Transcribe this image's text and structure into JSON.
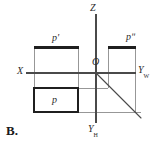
{
  "figure": {
    "item_label": "B.",
    "caption": "",
    "background_color": "#ffffff",
    "line_color": "#3a3a3a",
    "bold_line_color": "#1f1f1f",
    "text_color": "#2b2b2b",
    "axes": [
      {
        "id": "z",
        "label": "Z",
        "sub": "",
        "direction": "up"
      },
      {
        "id": "yw",
        "label": "Y",
        "sub": "W",
        "direction": "right"
      },
      {
        "id": "yh",
        "label": "Y",
        "sub": "H",
        "direction": "down"
      },
      {
        "id": "x",
        "label": "X",
        "sub": "",
        "direction": "left"
      }
    ],
    "origin_label": "O",
    "projections": [
      {
        "id": "front",
        "label": "p'",
        "name": "front-view"
      },
      {
        "id": "side",
        "label": "pʺ",
        "name": "side-view"
      },
      {
        "id": "top",
        "label": "p",
        "name": "top-view"
      }
    ],
    "geometry": {
      "origin": {
        "x": 96,
        "y": 73
      },
      "z_axis": {
        "x1": 96,
        "y1": 14,
        "x2": 96,
        "y2": 123
      },
      "x_axis": {
        "x1": 28,
        "y1": 73,
        "x2": 136,
        "y2": 73
      },
      "yw_axis": {
        "x1": 96,
        "y1": 73,
        "x2": 136,
        "y2": 73
      },
      "bisector": {
        "x1": 97,
        "y1": 74,
        "x2": 141,
        "y2": 118
      },
      "front_rect": {
        "x": 34,
        "y": 48,
        "w": 44,
        "h": 25
      },
      "top_rect": {
        "x": 34,
        "y": 88,
        "w": 44,
        "h": 24
      },
      "side_rect": {
        "x": 108,
        "y": 48,
        "w": 27,
        "h": 25
      },
      "construction_lines": [
        {
          "x1": 34,
          "y1": 48,
          "x2": 34,
          "y2": 112
        },
        {
          "x1": 78,
          "y1": 48,
          "x2": 78,
          "y2": 112
        },
        {
          "x1": 34,
          "y1": 73,
          "x2": 78,
          "y2": 73
        },
        {
          "x1": 34,
          "y1": 88,
          "x2": 96,
          "y2": 88
        },
        {
          "x1": 108,
          "y1": 48,
          "x2": 108,
          "y2": 88
        },
        {
          "x1": 135,
          "y1": 48,
          "x2": 135,
          "y2": 112
        },
        {
          "x1": 96,
          "y1": 112,
          "x2": 141,
          "y2": 112
        }
      ]
    }
  }
}
